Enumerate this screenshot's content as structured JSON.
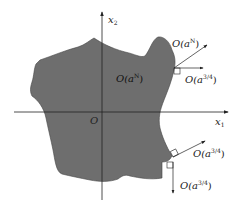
{
  "diagram": {
    "axes": {
      "x_label": "x",
      "x_sub": "1",
      "y_label": "x",
      "y_sub": "2",
      "origin_label": "O"
    },
    "region": {
      "label": "O(a",
      "label_sup": "N",
      "label_close": ")",
      "fill": "#6e6e6e"
    },
    "annotations": [
      {
        "text": "O(a",
        "sup": "N",
        "close": ")"
      },
      {
        "text": "O(a",
        "sup": "3/4",
        "close": ")"
      },
      {
        "text": "O(a",
        "sup": "3/4",
        "close": ")"
      },
      {
        "text": "O(a",
        "sup": "3/4",
        "close": ")"
      }
    ]
  }
}
